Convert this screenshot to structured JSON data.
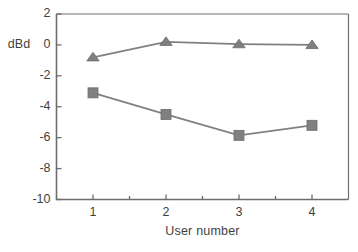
{
  "chart_data": {
    "type": "line",
    "title": "",
    "xlabel": "User number",
    "ylabel": "dBd",
    "categories": [
      "1",
      "2",
      "3",
      "4"
    ],
    "x": [
      1,
      2,
      3,
      4
    ],
    "ylim": [
      -10,
      2
    ],
    "xlim": [
      0.5,
      4.5
    ],
    "ytick_labels": [
      "2",
      "0",
      "-2",
      "-4",
      "-6",
      "-8",
      "-10"
    ],
    "yticks": [
      2,
      0,
      -2,
      -4,
      -6,
      -8,
      -10
    ],
    "xtick_labels": [
      "1",
      "2",
      "3",
      "4"
    ],
    "grid": false,
    "legend": "none",
    "series": [
      {
        "name": "triangle-series",
        "marker": "triangle",
        "color": "#808080",
        "values": [
          -0.8,
          0.2,
          0.05,
          0.0
        ]
      },
      {
        "name": "square-series",
        "marker": "square",
        "color": "#808080",
        "values": [
          -3.1,
          -4.5,
          -5.85,
          -5.2
        ]
      }
    ]
  },
  "axes": {
    "y_label": "dBd",
    "x_label": "User number",
    "y_ticks": [
      {
        "value": 2,
        "label": "2"
      },
      {
        "value": 0,
        "label": "0"
      },
      {
        "value": -2,
        "label": "-2"
      },
      {
        "value": -4,
        "label": "-4"
      },
      {
        "value": -6,
        "label": "-6"
      },
      {
        "value": -8,
        "label": "-8"
      },
      {
        "value": -10,
        "label": "-10"
      }
    ],
    "x_ticks": [
      {
        "value": 1,
        "label": "1"
      },
      {
        "value": 2,
        "label": "2"
      },
      {
        "value": 3,
        "label": "3"
      },
      {
        "value": 4,
        "label": "4"
      }
    ]
  },
  "colors": {
    "axis": "#6e6e6e",
    "series": "#808080",
    "text": "#3f3f3f",
    "background": "#ffffff"
  }
}
